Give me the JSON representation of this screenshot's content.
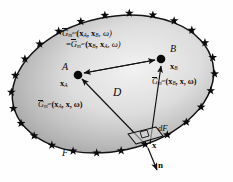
{
  "figure": {
    "type": "scientific-diagram",
    "background": "#fefefe",
    "domain_fill_dark": "#9e9e9e",
    "domain_fill_light": "#efefef",
    "outline_color": "#141414",
    "star_color": "#0b0b0b",
    "star_count": 26
  },
  "labels": {
    "reciprocity_line1": {
      "fn": "G",
      "bar": true,
      "sub": "m",
      "sup": "ar",
      "args": "(x",
      "arg1_sub": "A",
      "arg2": ", x",
      "arg2_sub": "B",
      "arg3": ", ω)"
    },
    "reciprocity_line2": {
      "eq": "=",
      "fn": "G",
      "bar": true,
      "sub": "m",
      "sup": "ar",
      "args": "(x",
      "arg1_sub": "B",
      "arg2": ", x",
      "arg2_sub": "A",
      "arg3": ", ω)"
    },
    "point_a": "A",
    "point_a_vec": "x",
    "point_a_vec_sub": "A",
    "point_b": "B",
    "point_b_vec": "x",
    "point_b_vec_sub": "B",
    "green_b": {
      "fn": "G",
      "sub": "m",
      "sup": "ar",
      "open": "(x",
      "s1": "B",
      "mid": ", x, ω)"
    },
    "green_a": {
      "fn": "G",
      "sub": "m",
      "sup": "ar",
      "open": "(x",
      "s1": "A",
      "mid": ", x, ω)"
    },
    "domain": "D",
    "surface_element": "dF",
    "surface_point": "x",
    "normal_vector": "n",
    "boundary": "F"
  },
  "geometry": {
    "ellipse_cx": 113,
    "ellipse_cy": 83,
    "ellipse_rx": 103,
    "ellipse_ry": 68,
    "ellipse_rotation_deg": -12,
    "point_a": [
      77,
      75
    ],
    "point_b": [
      161,
      59
    ],
    "surface_point": [
      148,
      148
    ],
    "normal_tip": [
      156,
      172
    ]
  }
}
